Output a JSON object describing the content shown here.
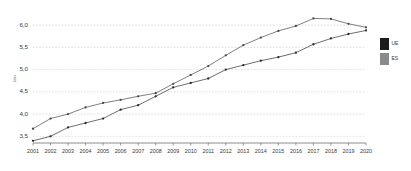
{
  "chart_data": {
    "type": "line",
    "title": "",
    "subtitle": "",
    "xlabel": "",
    "ylabel": "Índice",
    "x": [
      2001,
      2002,
      2003,
      2004,
      2005,
      2006,
      2007,
      2008,
      2009,
      2010,
      2011,
      2012,
      2013,
      2014,
      2015,
      2016,
      2017,
      2018,
      2019,
      2020
    ],
    "categories": [
      "2001",
      "2002",
      "2003",
      "2004",
      "2005",
      "2006",
      "2007",
      "2008",
      "2009",
      "2010",
      "2011",
      "2012",
      "2013",
      "2014",
      "2015",
      "2016",
      "2017",
      "2018",
      "2019",
      "2020"
    ],
    "series": [
      {
        "name": "UE",
        "color": "#4a4a4a",
        "values": [
          3.67,
          3.9,
          4.0,
          4.15,
          4.25,
          4.32,
          4.4,
          4.47,
          4.68,
          4.88,
          5.08,
          5.32,
          5.55,
          5.72,
          5.87,
          5.98,
          6.15,
          6.14,
          6.03,
          5.95
        ]
      },
      {
        "name": "ES",
        "color": "#2b2b2b",
        "values": [
          3.4,
          3.5,
          3.7,
          3.8,
          3.9,
          4.1,
          4.2,
          4.4,
          4.6,
          4.7,
          4.8,
          5.0,
          5.1,
          5.2,
          5.28,
          5.38,
          5.57,
          5.7,
          5.8,
          5.88
        ]
      }
    ],
    "ylim": [
      3.35,
      6.25
    ],
    "yticks": [
      3.5,
      4.0,
      4.5,
      5.0,
      5.5,
      6.0
    ],
    "ytick_labels": [
      "3,5",
      "4,0",
      "4,5",
      "5,0",
      "5,5",
      "6,0"
    ],
    "xlim": [
      2001,
      2020
    ],
    "grid": true,
    "grid_axis": "y",
    "legend_position": "right"
  },
  "legend": {
    "entries": [
      {
        "label": "UE",
        "swatch": "#1c1c1c"
      },
      {
        "label": "ES",
        "swatch": "#8a8a8a"
      }
    ]
  }
}
